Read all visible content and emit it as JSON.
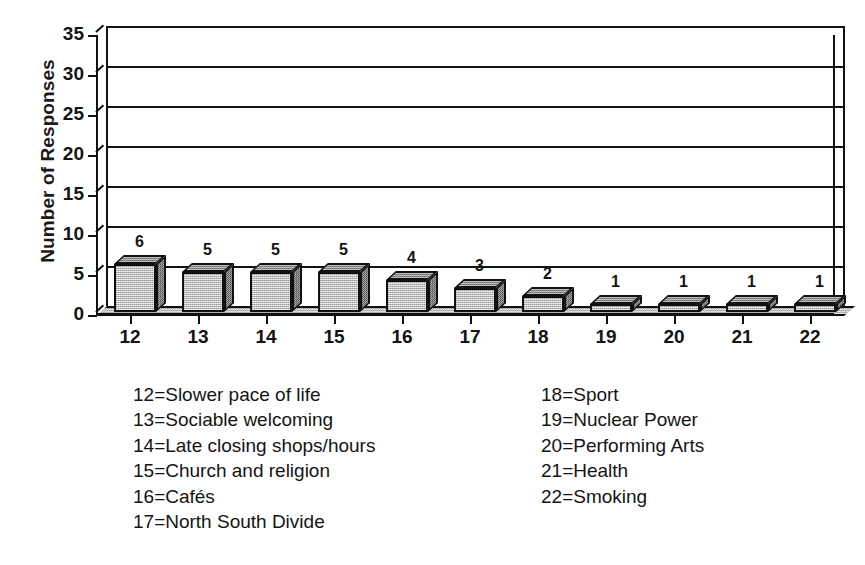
{
  "chart_data": {
    "type": "bar",
    "title": "",
    "xlabel": "",
    "ylabel": "Number of Responses",
    "categories": [
      "12",
      "13",
      "14",
      "15",
      "16",
      "17",
      "18",
      "19",
      "20",
      "21",
      "22"
    ],
    "values": [
      6,
      5,
      5,
      5,
      4,
      3,
      2,
      1,
      1,
      1,
      1
    ],
    "data_labels": [
      "6",
      "5",
      "5",
      "5",
      "4",
      "3",
      "2",
      "1",
      "1",
      "1",
      "1"
    ],
    "ylim": [
      0,
      35
    ],
    "yticks": [
      "0",
      "5",
      "10",
      "15",
      "20",
      "25",
      "30",
      "35"
    ],
    "ytick_values": [
      0,
      5,
      10,
      15,
      20,
      25,
      30,
      35
    ],
    "grid": true,
    "legend_position": "below",
    "style": "3d-bar",
    "colors": {
      "bar_front": "#bdbdbd",
      "bar_side": "#6f6f6f",
      "bar_top": "#8d8d8d",
      "axis": "#111111",
      "text": "#141414",
      "background": "#ffffff",
      "floor": "#9a9a9a"
    },
    "legend_entries": [
      {
        "key": "12",
        "label": "12=Slower pace of life"
      },
      {
        "key": "13",
        "label": "13=Sociable welcoming"
      },
      {
        "key": "14",
        "label": "14=Late closing shops/hours"
      },
      {
        "key": "15",
        "label": "15=Church and religion"
      },
      {
        "key": "16",
        "label": "16=Cafés"
      },
      {
        "key": "17",
        "label": "17=North South Divide"
      },
      {
        "key": "18",
        "label": "18=Sport"
      },
      {
        "key": "19",
        "label": "19=Nuclear Power"
      },
      {
        "key": "20",
        "label": "20=Performing Arts"
      },
      {
        "key": "21",
        "label": "21=Health"
      },
      {
        "key": "22",
        "label": "22=Smoking"
      }
    ]
  },
  "legend": {
    "left_column": [
      "12=Slower pace of life",
      "13=Sociable welcoming",
      "14=Late closing shops/hours",
      "15=Church and religion",
      "16=Cafés",
      "17=North South Divide"
    ],
    "right_column": [
      "18=Sport",
      "19=Nuclear Power",
      "20=Performing Arts",
      "21=Health",
      "22=Smoking"
    ]
  }
}
